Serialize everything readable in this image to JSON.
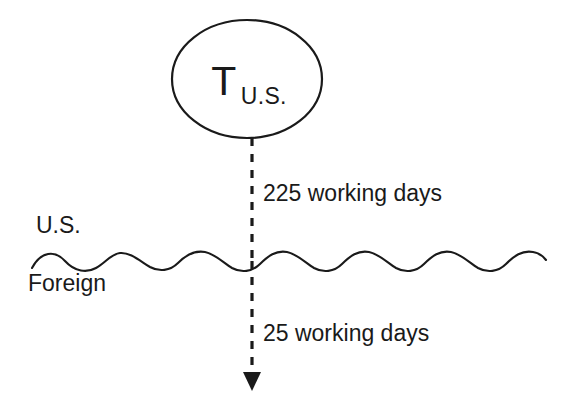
{
  "diagram": {
    "node": {
      "base_symbol": "T",
      "subscript": "U.S.",
      "shape": "ellipse"
    },
    "boundary": {
      "style": "wavy-line",
      "upper_label": "U.S.",
      "lower_label": "Foreign"
    },
    "flow_arrow": {
      "style": "dashed-down-arrow",
      "upper_segment_label": "225 working days",
      "lower_segment_label": "25 working days"
    },
    "colors": {
      "ink": "#1a1a1a",
      "background": "#ffffff"
    }
  }
}
